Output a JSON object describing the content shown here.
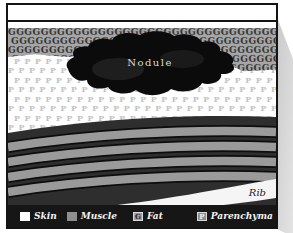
{
  "diagram": {
    "nodule_label": "Nodule",
    "rib_label": "Rib",
    "fat_pattern_char": "G",
    "parenchyma_pattern_char": "P"
  },
  "legend": {
    "items": [
      {
        "label": "Skin"
      },
      {
        "label": "Muscle"
      },
      {
        "label": "Fat",
        "swatch_char": "G"
      },
      {
        "label": "Parenchyma",
        "swatch_char": "P"
      },
      {
        "label": "Rib cage"
      }
    ]
  },
  "colors": {
    "fat_band_bg": "#a6a6a6",
    "fat_letter": "#383838",
    "parenchyma_letter": "#c2c2c2",
    "muscle_dark": "#2e2e2e",
    "muscle_light": "#9a9a9a",
    "nodule_fill": "#0b0b0b",
    "rib_fill": "#f5f5f5",
    "legend_bg": "#161616",
    "border": "#141414"
  }
}
